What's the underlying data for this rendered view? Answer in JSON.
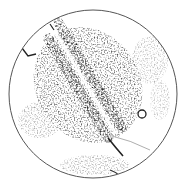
{
  "image": {
    "subject": "micrograph-field",
    "shape": "circle",
    "background": "#ffffff",
    "border_color": "#555555",
    "ink_color": "#1a1a1a",
    "circle": {
      "cx": 93,
      "cy": 94,
      "r": 84
    },
    "bands": [
      {
        "name": "upper-band",
        "x1": 58,
        "y1": 22,
        "x2": 122,
        "y2": 128,
        "width": 9
      },
      {
        "name": "lower-band",
        "x1": 48,
        "y1": 38,
        "x2": 108,
        "y2": 138,
        "width": 9
      }
    ],
    "tail": {
      "x1": 108,
      "y1": 138,
      "x2": 122,
      "y2": 155
    },
    "ring": {
      "cx": 142,
      "cy": 114,
      "r": 4
    },
    "hook": {
      "x": 24,
      "y": 52
    }
  }
}
